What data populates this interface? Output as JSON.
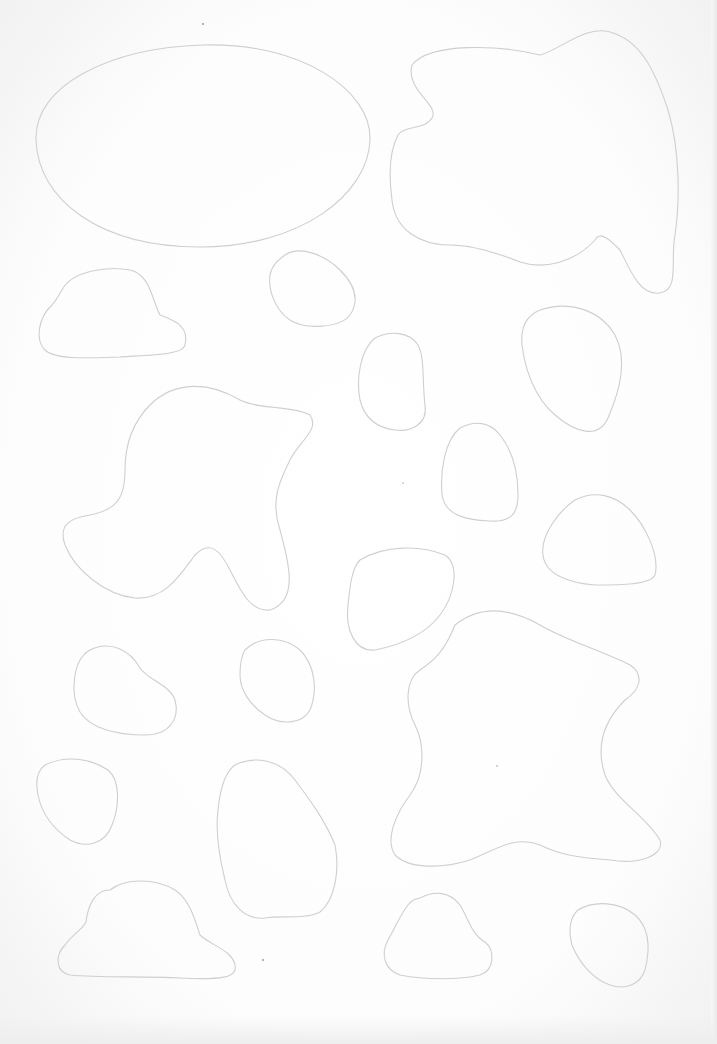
{
  "page": {
    "background": "#fefefe",
    "stroke_color": "#cfcfcf",
    "speck_color": "#9a9a9a"
  },
  "shapes": [
    {
      "id": "ellipse-large",
      "kind": "ellipse",
      "d": "M 203 45 C 300 42 372 90 370 140 C 368 195 300 247 200 247 C 100 247 38 200 36 140 C 34 85 110 48 203 45 Z"
    },
    {
      "id": "blob-top-right",
      "kind": "blob",
      "d": "M 412 65 C 430 42 500 45 540 55 C 560 50 585 25 610 32 C 640 40 655 70 668 110 C 680 150 680 200 675 235 C 670 260 680 290 660 293 C 640 296 630 270 620 250 C 610 240 600 230 595 240 C 575 262 545 270 520 262 C 495 252 470 245 450 245 C 420 245 395 230 392 200 C 388 170 390 150 398 135 C 405 125 425 130 432 118 C 440 105 405 90 412 65 Z"
    },
    {
      "id": "cloud-left",
      "kind": "blob",
      "d": "M 62 290 C 72 270 110 266 130 270 C 150 274 152 300 160 315 C 172 320 190 325 185 345 C 183 355 150 355 120 357 C 90 358 55 360 45 350 C 35 340 38 318 52 305 C 58 298 58 296 62 290 Z"
    },
    {
      "id": "pebble-1",
      "kind": "blob",
      "d": "M 285 255 C 300 245 325 255 340 270 C 355 285 360 300 350 315 C 340 328 305 330 290 320 C 275 310 268 290 270 275 C 272 265 278 260 285 255 Z"
    },
    {
      "id": "rounded-rect-mid",
      "kind": "blob",
      "d": "M 375 338 C 390 330 410 332 418 345 C 425 358 422 380 425 405 C 428 425 410 432 395 430 C 378 428 365 420 360 400 C 356 380 360 350 375 338 Z"
    },
    {
      "id": "rounded-triangle-right",
      "kind": "blob",
      "d": "M 540 310 C 570 300 600 310 615 335 C 628 360 620 390 608 418 C 598 440 575 432 555 415 C 535 398 525 370 522 345 C 520 325 528 315 540 310 Z"
    },
    {
      "id": "blob-mid-left",
      "kind": "blob",
      "d": "M 150 405 C 175 380 210 382 240 400 C 260 410 290 405 310 415 C 320 430 300 440 290 460 C 280 480 270 500 280 530 C 288 560 300 600 270 610 C 250 612 240 590 230 570 C 220 550 210 540 195 555 C 180 575 165 600 135 598 C 105 595 75 570 65 545 C 58 525 70 518 90 515 C 115 510 125 500 125 470 C 125 440 135 420 150 405 Z"
    },
    {
      "id": "bell-mid",
      "kind": "blob",
      "d": "M 460 428 C 475 420 490 422 500 435 C 512 450 518 470 518 495 C 518 515 510 522 490 521 C 465 520 445 515 442 495 C 440 470 445 440 460 428 Z"
    },
    {
      "id": "mound-right",
      "kind": "blob",
      "d": "M 575 500 C 595 490 615 495 630 510 C 645 525 660 555 655 575 C 650 585 620 585 595 585 C 570 583 545 575 543 555 C 540 535 560 510 575 500 Z"
    },
    {
      "id": "faint-blob-center",
      "kind": "blob",
      "d": "M 360 560 C 385 545 420 545 445 555 C 460 565 455 595 440 615 C 425 635 400 645 375 650 C 355 652 345 630 348 605 C 350 585 352 568 360 560 Z"
    },
    {
      "id": "pebble-lower-left",
      "kind": "blob",
      "d": "M 90 650 C 110 640 130 650 140 668 C 148 680 170 685 175 700 C 180 718 170 735 145 735 C 115 735 90 728 80 712 C 70 695 72 660 90 650 Z"
    },
    {
      "id": "pebble-lower-mid",
      "kind": "blob",
      "d": "M 245 650 C 260 635 285 637 300 650 C 315 665 318 690 310 710 C 302 725 280 725 265 715 C 250 705 240 690 240 675 C 240 665 242 655 245 650 Z"
    },
    {
      "id": "star-blob-large",
      "kind": "blob",
      "d": "M 455 625 C 480 605 510 608 540 625 C 565 640 600 650 630 665 C 645 675 640 690 625 700 C 605 720 595 745 605 775 C 615 800 645 815 660 840 C 665 855 640 865 610 860 C 580 858 560 855 540 845 C 515 835 495 850 470 860 C 445 868 410 870 395 855 C 385 840 395 815 410 795 C 425 775 425 745 415 725 C 405 705 405 680 420 670 C 435 660 445 650 455 625 Z"
    },
    {
      "id": "pebble-far-left",
      "kind": "blob",
      "d": "M 45 765 C 65 755 90 758 108 770 C 120 780 120 805 112 825 C 105 845 85 848 70 840 C 55 830 42 815 38 795 C 35 780 38 770 45 765 Z"
    },
    {
      "id": "tall-blob-center-left",
      "kind": "blob",
      "d": "M 235 765 C 255 755 280 760 295 780 C 310 800 325 820 335 845 C 340 870 335 900 320 912 C 305 920 280 915 265 918 C 245 920 230 905 225 880 C 220 860 215 835 218 810 C 220 790 225 772 235 765 Z"
    },
    {
      "id": "cloud-bottom-left",
      "kind": "blob",
      "d": "M 110 890 C 125 878 155 878 175 890 C 190 900 195 920 200 935 C 210 945 232 950 235 965 C 238 978 220 980 180 978 C 140 976 100 978 70 975 C 55 972 55 955 65 945 C 72 935 82 930 86 922 C 88 905 95 890 110 890 Z"
    },
    {
      "id": "bell-bottom",
      "kind": "blob",
      "d": "M 420 898 C 435 890 450 892 460 905 C 468 918 472 935 485 942 C 495 950 495 970 480 975 C 460 980 425 980 400 975 C 385 970 380 955 388 940 C 395 928 400 915 408 905 C 412 900 415 899 420 898 Z"
    },
    {
      "id": "pebble-bottom-right",
      "kind": "blob",
      "d": "M 578 910 C 595 900 620 902 635 915 C 650 928 650 950 645 970 C 640 985 625 990 610 985 C 595 980 580 965 572 945 C 568 930 570 917 578 910 Z"
    }
  ],
  "specks": [
    {
      "x": 203,
      "y": 24,
      "r": 1
    },
    {
      "x": 263,
      "y": 960,
      "r": 1
    },
    {
      "x": 497,
      "y": 766,
      "r": 0.8
    },
    {
      "x": 403,
      "y": 483,
      "r": 0.7
    }
  ]
}
